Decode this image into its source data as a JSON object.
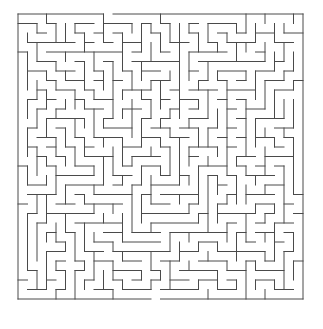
{
  "document": {
    "title": "Maze Puzzle",
    "type": "maze-puzzle-image",
    "background_color": "#ffffff"
  },
  "maze": {
    "name": "rectangular-perfect-maze",
    "cols": 30,
    "rows": 30,
    "cell_size_px": 9.5,
    "origin_x_px": 18,
    "origin_y_px": 14,
    "width_px": 285,
    "height_px": 285,
    "wall_color": "#4a4a4a",
    "wall_thickness_px": 1,
    "background_color": "#ffffff",
    "entrance": {
      "label": "entrance",
      "edge": "top",
      "col": 9,
      "x_px": 103.5,
      "y_px": 14
    },
    "exit": {
      "label": "exit",
      "edge": "bottom",
      "col": 14,
      "x_px": 151,
      "y_px": 299
    },
    "border": {
      "top_gap_cols": [
        9
      ],
      "bottom_gap_cols": [
        14
      ],
      "left_gap_cols": [],
      "right_gap_cols": []
    },
    "seed": 20240517,
    "algorithm": "recursive-backtracker",
    "h_walls_removed_note": "wall set derived deterministically from seed",
    "caption": ""
  }
}
